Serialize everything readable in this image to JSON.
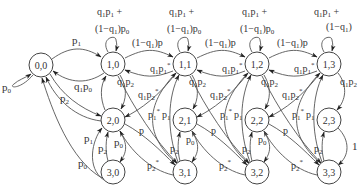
{
  "diagram": {
    "type": "markov-chain-state-diagram",
    "nodes": [
      {
        "id": "0,0",
        "label": "0,0",
        "x": 41,
        "y": 65
      },
      {
        "id": "1,0",
        "label": "1,0",
        "x": 113,
        "y": 64
      },
      {
        "id": "1,1",
        "label": "1,1",
        "x": 185,
        "y": 64
      },
      {
        "id": "1,2",
        "label": "1,2",
        "x": 257,
        "y": 64
      },
      {
        "id": "1,3",
        "label": "1,3",
        "x": 329,
        "y": 64
      },
      {
        "id": "2,0",
        "label": "2,0",
        "x": 113,
        "y": 120
      },
      {
        "id": "2,1",
        "label": "2,1",
        "x": 185,
        "y": 120
      },
      {
        "id": "2,2",
        "label": "2,2",
        "x": 257,
        "y": 120
      },
      {
        "id": "2,3",
        "label": "2,3",
        "x": 329,
        "y": 120
      },
      {
        "id": "3,0",
        "label": "3,0",
        "x": 113,
        "y": 172
      },
      {
        "id": "3,1",
        "label": "3,1",
        "x": 185,
        "y": 172
      },
      {
        "id": "3,2",
        "label": "3,2",
        "x": 257,
        "y": 172
      },
      {
        "id": "3,3",
        "label": "3,3",
        "x": 329,
        "y": 172
      }
    ],
    "labels": {
      "self_00": "p",
      "self_00_sub": "0",
      "e00_10": "p",
      "e00_10_sub": "1",
      "e10_00": "q",
      "e10_00_a": "1",
      "e10_00_b": "p",
      "e10_00_c": "0",
      "self_top_line1": "q",
      "self_top_line1_a": "1",
      "self_top_line1_b": "p",
      "self_top_line1_c": "1",
      "self_top_line1_d": " +",
      "self_top_line2": "(1−q",
      "self_top_line2_a": "1",
      "self_top_line2_b": ")p",
      "self_top_line2_c": "0",
      "self_top_last_line2": "(1−q",
      "self_top_last_line2_a": "1",
      "self_top_last_line2_b": ")",
      "right_fwd": "(1−q",
      "right_fwd_a": "1",
      "right_fwd_b": ")p",
      "left_back": "q",
      "left_back_a": "1",
      "left_back_b": "p",
      "left_back_c": "1",
      "left_back_star": "*",
      "down_q1p2": "q",
      "down_q1p2_a": "1",
      "down_q1p2_b": "p",
      "down_q1p2_c": "2",
      "diag_q1p2star": "q",
      "diag_q1p2star_a": "1",
      "diag_q1p2star_b": "p",
      "diag_q1p2star_c": "2",
      "p1star": "p",
      "p1star_sub": "1",
      "star": "*",
      "p1": "p",
      "p1_sub": "1",
      "p": "p",
      "p0": "p",
      "p0_sub": "0",
      "p2": "p",
      "p2_sub": "2",
      "p2star": "p",
      "p2star_sub": "2",
      "one": "1"
    }
  }
}
